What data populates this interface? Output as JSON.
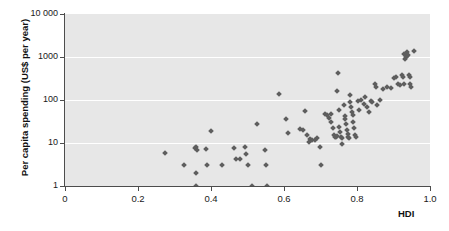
{
  "chart_data": {
    "type": "scatter",
    "title": "",
    "xlabel": "HDI",
    "ylabel": "Per capita spending (US$ per year)",
    "xlim": [
      0,
      1.0
    ],
    "ylim": [
      1,
      10000
    ],
    "yscale": "log",
    "xscale": "linear",
    "grid": true,
    "grid_orientation": "horizontal",
    "legend": "none",
    "plot_background": "#e7e7e7",
    "point_color": "#5e5e5e",
    "point_marker": "diamond",
    "xticks": [
      {
        "value": 0,
        "label": "0"
      },
      {
        "value": 0.2,
        "label": "0.2"
      },
      {
        "value": 0.4,
        "label": "0.4"
      },
      {
        "value": 0.6,
        "label": "0.6"
      },
      {
        "value": 0.8,
        "label": "0.8"
      },
      {
        "value": 1.0,
        "label": "1.0"
      }
    ],
    "yticks": [
      {
        "value": 1,
        "label": "1"
      },
      {
        "value": 10,
        "label": "10"
      },
      {
        "value": 100,
        "label": "100"
      },
      {
        "value": 1000,
        "label": "1000"
      },
      {
        "value": 10000,
        "label": "10 000"
      }
    ],
    "points": [
      {
        "x": 0.275,
        "y": 6.0
      },
      {
        "x": 0.325,
        "y": 3.0
      },
      {
        "x": 0.355,
        "y": 7.5
      },
      {
        "x": 0.36,
        "y": 8.0
      },
      {
        "x": 0.362,
        "y": 7.0
      },
      {
        "x": 0.358,
        "y": 2.0
      },
      {
        "x": 0.36,
        "y": 1.0
      },
      {
        "x": 0.385,
        "y": 7.2
      },
      {
        "x": 0.39,
        "y": 3.0
      },
      {
        "x": 0.4,
        "y": 19.0
      },
      {
        "x": 0.43,
        "y": 3.0
      },
      {
        "x": 0.462,
        "y": 7.8
      },
      {
        "x": 0.468,
        "y": 4.2
      },
      {
        "x": 0.48,
        "y": 4.2
      },
      {
        "x": 0.492,
        "y": 8.0
      },
      {
        "x": 0.495,
        "y": 5.6
      },
      {
        "x": 0.5,
        "y": 3.0
      },
      {
        "x": 0.512,
        "y": 1.0
      },
      {
        "x": 0.525,
        "y": 27.0
      },
      {
        "x": 0.548,
        "y": 7.0
      },
      {
        "x": 0.552,
        "y": 3.0
      },
      {
        "x": 0.553,
        "y": 1.0
      },
      {
        "x": 0.585,
        "y": 135.0
      },
      {
        "x": 0.605,
        "y": 37.0
      },
      {
        "x": 0.61,
        "y": 17.0
      },
      {
        "x": 0.645,
        "y": 21.0
      },
      {
        "x": 0.652,
        "y": 20.0
      },
      {
        "x": 0.658,
        "y": 55.0
      },
      {
        "x": 0.662,
        "y": 15.0
      },
      {
        "x": 0.668,
        "y": 10.5
      },
      {
        "x": 0.672,
        "y": 12.5
      },
      {
        "x": 0.678,
        "y": 12.0
      },
      {
        "x": 0.685,
        "y": 12.0
      },
      {
        "x": 0.69,
        "y": 13.0
      },
      {
        "x": 0.698,
        "y": 8.2
      },
      {
        "x": 0.7,
        "y": 3.0
      },
      {
        "x": 0.712,
        "y": 47.0
      },
      {
        "x": 0.718,
        "y": 45.0
      },
      {
        "x": 0.722,
        "y": 38.0
      },
      {
        "x": 0.728,
        "y": 48.0
      },
      {
        "x": 0.73,
        "y": 30.0
      },
      {
        "x": 0.735,
        "y": 22.0
      },
      {
        "x": 0.738,
        "y": 15.0
      },
      {
        "x": 0.74,
        "y": 14.0
      },
      {
        "x": 0.742,
        "y": 13.5
      },
      {
        "x": 0.744,
        "y": 14.5
      },
      {
        "x": 0.745,
        "y": 160.0
      },
      {
        "x": 0.748,
        "y": 420.0
      },
      {
        "x": 0.75,
        "y": 60.0
      },
      {
        "x": 0.752,
        "y": 24.0
      },
      {
        "x": 0.754,
        "y": 18.0
      },
      {
        "x": 0.756,
        "y": 14.0
      },
      {
        "x": 0.758,
        "y": 13.0
      },
      {
        "x": 0.76,
        "y": 9.5
      },
      {
        "x": 0.764,
        "y": 75.0
      },
      {
        "x": 0.766,
        "y": 42.0
      },
      {
        "x": 0.768,
        "y": 36.0
      },
      {
        "x": 0.77,
        "y": 27.0
      },
      {
        "x": 0.772,
        "y": 20.0
      },
      {
        "x": 0.774,
        "y": 16.0
      },
      {
        "x": 0.776,
        "y": 14.0
      },
      {
        "x": 0.778,
        "y": 13.0
      },
      {
        "x": 0.78,
        "y": 130.0
      },
      {
        "x": 0.782,
        "y": 88.0
      },
      {
        "x": 0.784,
        "y": 70.0
      },
      {
        "x": 0.786,
        "y": 52.0
      },
      {
        "x": 0.788,
        "y": 44.0
      },
      {
        "x": 0.79,
        "y": 30.0
      },
      {
        "x": 0.792,
        "y": 22.0
      },
      {
        "x": 0.794,
        "y": 15.0
      },
      {
        "x": 0.796,
        "y": 14.0
      },
      {
        "x": 0.802,
        "y": 95.0
      },
      {
        "x": 0.806,
        "y": 58.0
      },
      {
        "x": 0.812,
        "y": 100.0
      },
      {
        "x": 0.818,
        "y": 80.0
      },
      {
        "x": 0.822,
        "y": 120.0
      },
      {
        "x": 0.828,
        "y": 70.0
      },
      {
        "x": 0.832,
        "y": 52.0
      },
      {
        "x": 0.838,
        "y": 95.0
      },
      {
        "x": 0.842,
        "y": 90.0
      },
      {
        "x": 0.848,
        "y": 230.0
      },
      {
        "x": 0.852,
        "y": 200.0
      },
      {
        "x": 0.856,
        "y": 75.0
      },
      {
        "x": 0.862,
        "y": 100.0
      },
      {
        "x": 0.872,
        "y": 180.0
      },
      {
        "x": 0.882,
        "y": 200.0
      },
      {
        "x": 0.892,
        "y": 195.0
      },
      {
        "x": 0.902,
        "y": 330.0
      },
      {
        "x": 0.908,
        "y": 340.0
      },
      {
        "x": 0.912,
        "y": 230.0
      },
      {
        "x": 0.918,
        "y": 225.0
      },
      {
        "x": 0.922,
        "y": 380.0
      },
      {
        "x": 0.926,
        "y": 350.0
      },
      {
        "x": 0.928,
        "y": 240.0
      },
      {
        "x": 0.93,
        "y": 1150.0
      },
      {
        "x": 0.932,
        "y": 900.0
      },
      {
        "x": 0.934,
        "y": 1000.0
      },
      {
        "x": 0.936,
        "y": 1300.0
      },
      {
        "x": 0.938,
        "y": 1050.0
      },
      {
        "x": 0.94,
        "y": 1100.0
      },
      {
        "x": 0.942,
        "y": 380.0
      },
      {
        "x": 0.944,
        "y": 350.0
      },
      {
        "x": 0.946,
        "y": 230.0
      },
      {
        "x": 0.948,
        "y": 200.0
      },
      {
        "x": 0.955,
        "y": 1400.0
      }
    ]
  }
}
